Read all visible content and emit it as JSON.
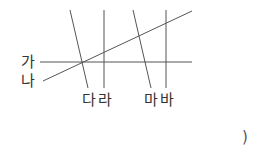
{
  "diagram": {
    "type": "lines-intersection",
    "stroke_color": "#555555",
    "lines": [
      {
        "id": "ga",
        "label": "가",
        "x1": 40,
        "y1": 62,
        "x2": 192,
        "y2": 62
      },
      {
        "id": "na",
        "label": "나",
        "x1": 43,
        "y1": 81,
        "x2": 192,
        "y2": 11
      },
      {
        "id": "da",
        "label": "다",
        "x1": 70,
        "y1": 10,
        "x2": 88,
        "y2": 88
      },
      {
        "id": "ra",
        "label": "라",
        "x1": 104,
        "y1": 10,
        "x2": 104,
        "y2": 88
      },
      {
        "id": "ma",
        "label": "마",
        "x1": 133,
        "y1": 10,
        "x2": 151,
        "y2": 88
      },
      {
        "id": "ba",
        "label": "바",
        "x1": 166,
        "y1": 10,
        "x2": 166,
        "y2": 88
      }
    ],
    "labels": {
      "ga": "가",
      "na": "나",
      "dara": "다라",
      "maba": "마바"
    },
    "answer_paren": ")"
  }
}
